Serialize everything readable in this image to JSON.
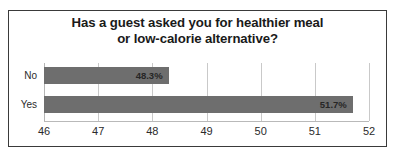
{
  "chart_data": {
    "type": "bar",
    "orientation": "horizontal",
    "title": "Has a guest asked you for healthier meal or low-calorie alternative?",
    "title_lines": [
      "Has a guest asked you for healthier meal",
      "or low-calorie alternative?"
    ],
    "categories": [
      "No",
      "Yes"
    ],
    "values": [
      48.3,
      51.7
    ],
    "data_labels": [
      "48.3%",
      "51.7%"
    ],
    "xlabel": "",
    "ylabel": "",
    "xlim": [
      46,
      52
    ],
    "xticks": [
      46,
      47,
      48,
      49,
      50,
      51,
      52
    ],
    "xtick_labels": [
      "46",
      "47",
      "48",
      "49",
      "50",
      "51",
      "52"
    ],
    "grid": true,
    "grid_axis": "x",
    "legend": false,
    "bar_color": "#6e6e6e",
    "border_color": "#3a3a3a",
    "background": "#ffffff"
  }
}
